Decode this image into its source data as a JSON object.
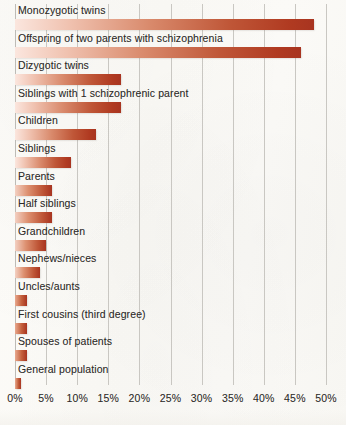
{
  "chart_data": {
    "type": "bar",
    "orientation": "horizontal",
    "title": "",
    "subtitle": "",
    "xlabel": "",
    "ylabel": "",
    "xlim": [
      0,
      50
    ],
    "xunit": "%",
    "grid": true,
    "legend": "none",
    "xticks": [
      0,
      5,
      10,
      15,
      20,
      25,
      30,
      35,
      40,
      45,
      50
    ],
    "xticklabels": [
      "0%",
      "5%",
      "10%",
      "15%",
      "20%",
      "25%",
      "30%",
      "35%",
      "40%",
      "45%",
      "50%"
    ],
    "categories": [
      "Monozygotic twins",
      "Offspring of two parents with schizophrenia",
      "Dizygotic twins",
      "Siblings with 1 schizophrenic parent",
      "Children",
      "Siblings",
      "Parents",
      "Half siblings",
      "Grandchildren",
      "Nephews/nieces",
      "Uncles/aunts",
      "First cousins (third degree)",
      "Spouses of patients",
      "General population"
    ],
    "values": [
      48,
      46,
      17,
      17,
      13,
      9,
      6,
      6,
      5,
      4,
      2,
      2,
      2,
      1
    ],
    "bar_color_light": "#fbe6de",
    "bar_color_dark": "#a83420"
  },
  "axis": {
    "ticks": [
      {
        "label": "0%",
        "value": 0
      },
      {
        "label": "5%",
        "value": 5
      },
      {
        "label": "10%",
        "value": 10
      },
      {
        "label": "15%",
        "value": 15
      },
      {
        "label": "20%",
        "value": 20
      },
      {
        "label": "25%",
        "value": 25
      },
      {
        "label": "30%",
        "value": 30
      },
      {
        "label": "35%",
        "value": 35
      },
      {
        "label": "40%",
        "value": 40
      },
      {
        "label": "45%",
        "value": 45
      },
      {
        "label": "50%",
        "value": 50
      }
    ]
  },
  "rows": [
    {
      "label": "Monozygotic twins",
      "value": 48
    },
    {
      "label": "Offspring of two parents with schizophrenia",
      "value": 46
    },
    {
      "label": "Dizygotic twins",
      "value": 17
    },
    {
      "label": "Siblings with 1 schizophrenic parent",
      "value": 17
    },
    {
      "label": "Children",
      "value": 13
    },
    {
      "label": "Siblings",
      "value": 9
    },
    {
      "label": "Parents",
      "value": 6
    },
    {
      "label": "Half siblings",
      "value": 6
    },
    {
      "label": "Grandchildren",
      "value": 5
    },
    {
      "label": "Nephews/nieces",
      "value": 4
    },
    {
      "label": "Uncles/aunts",
      "value": 2
    },
    {
      "label": "First cousins (third degree)",
      "value": 2
    },
    {
      "label": "Spouses of patients",
      "value": 2
    },
    {
      "label": "General population",
      "value": 1
    }
  ]
}
